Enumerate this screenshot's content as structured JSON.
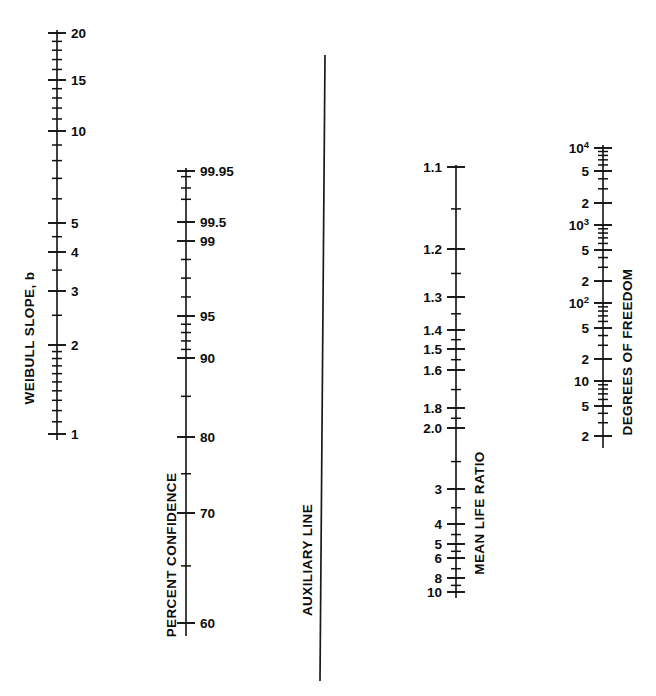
{
  "figure": {
    "type": "nomogram",
    "width": 656,
    "height": 696,
    "background": "#ffffff",
    "ink_color": "#111111"
  },
  "chart_data": {
    "type": "table",
    "title": "",
    "subtitle": "",
    "xlabel": "",
    "ylabel": "",
    "grid": false,
    "legend": "none",
    "scales": [
      {
        "name": "weibull-slope",
        "title": "WEIBULL SLOPE, b",
        "orientation": "vertical",
        "scale_type": "log",
        "direction": "increasing-upward",
        "axis_x": 57,
        "axis_top": 30,
        "axis_bottom": 440,
        "label_side": "right",
        "range": [
          1,
          20
        ],
        "labeled_ticks": [
          {
            "value": 20,
            "label": "20",
            "y": 33
          },
          {
            "value": 15,
            "label": "15",
            "y": 80
          },
          {
            "value": 10,
            "label": "10",
            "y": 131
          },
          {
            "value": 5,
            "label": "5",
            "y": 223
          },
          {
            "value": 4,
            "label": "4",
            "y": 252
          },
          {
            "value": 3,
            "label": "3",
            "y": 291
          },
          {
            "value": 2,
            "label": "2",
            "y": 345
          },
          {
            "value": 1,
            "label": "1",
            "y": 434
          }
        ],
        "minor_ticks": [
          19,
          18,
          17,
          16,
          14,
          13,
          12,
          11,
          9,
          8,
          7,
          6,
          4.5,
          3.5,
          2.5,
          1.9,
          1.8,
          1.7,
          1.6,
          1.5,
          1.4,
          1.3,
          1.2,
          1.1
        ]
      },
      {
        "name": "percent-confidence",
        "title": "PERCENT CONFIDENCE",
        "orientation": "vertical",
        "scale_type": "probability",
        "direction": "increasing-upward",
        "axis_x": 186,
        "axis_top": 168,
        "axis_bottom": 636,
        "label_side": "right",
        "range": [
          55,
          99.95
        ],
        "labeled_ticks": [
          {
            "value": 99.95,
            "label": "99.95",
            "y": 171
          },
          {
            "value": 99.5,
            "label": "99.5",
            "y": 222
          },
          {
            "value": 99,
            "label": "99",
            "y": 241
          },
          {
            "value": 95,
            "label": "95",
            "y": 316
          },
          {
            "value": 90,
            "label": "90",
            "y": 358
          },
          {
            "value": 80,
            "label": "80",
            "y": 437
          },
          {
            "value": 70,
            "label": "70",
            "y": 513
          },
          {
            "value": 60,
            "label": "60",
            "y": 623
          }
        ],
        "minor_ticks": [
          99.9,
          99.8,
          99.7,
          98,
          97,
          96,
          94,
          93,
          92,
          91,
          85,
          75,
          65,
          57
        ]
      },
      {
        "name": "auxiliary-line",
        "title": "AUXILIARY LINE",
        "orientation": "vertical",
        "scale_type": "none",
        "axis_x_top": 325,
        "axis_x_bottom": 320,
        "axis_top": 55,
        "axis_bottom": 681,
        "labeled_ticks": [],
        "minor_ticks": []
      },
      {
        "name": "mean-life-ratio",
        "title": "MEAN LIFE RATIO",
        "orientation": "vertical",
        "scale_type": "log",
        "direction": "increasing-downward",
        "axis_x": 456,
        "axis_top": 165,
        "axis_bottom": 598,
        "label_side": "left",
        "range": [
          1.1,
          10
        ],
        "labeled_ticks": [
          {
            "value": 1.1,
            "label": "1.1",
            "y": 167
          },
          {
            "value": 1.2,
            "label": "1.2",
            "y": 249
          },
          {
            "value": 1.3,
            "label": "1.3",
            "y": 297
          },
          {
            "value": 1.4,
            "label": "1.4",
            "y": 330
          },
          {
            "value": 1.5,
            "label": "1.5",
            "y": 349
          },
          {
            "value": 1.6,
            "label": "1.6",
            "y": 370
          },
          {
            "value": 1.8,
            "label": "1.8",
            "y": 408
          },
          {
            "value": 2.0,
            "label": "2.0",
            "y": 428
          },
          {
            "value": 3,
            "label": "3",
            "y": 489
          },
          {
            "value": 4,
            "label": "4",
            "y": 524
          },
          {
            "value": 5,
            "label": "5",
            "y": 544
          },
          {
            "value": 6,
            "label": "6",
            "y": 558
          },
          {
            "value": 8,
            "label": "8",
            "y": 578
          },
          {
            "value": 10,
            "label": "10",
            "y": 592
          }
        ],
        "minor_ticks": [
          1.15,
          1.25,
          1.35,
          1.45,
          1.55,
          1.7,
          1.9,
          2.5,
          3.5,
          4.5,
          5.5,
          7,
          9
        ]
      },
      {
        "name": "degrees-of-freedom",
        "title": "DEGREES OF FREEDOM",
        "orientation": "vertical",
        "scale_type": "log",
        "direction": "increasing-upward",
        "axis_x": 603,
        "axis_top": 145,
        "axis_bottom": 448,
        "label_side": "left",
        "range": [
          2,
          10000
        ],
        "labeled_ticks": [
          {
            "value": 10000,
            "label": "10",
            "superscript": "4",
            "y": 148
          },
          {
            "value": 5000,
            "label": "5",
            "superscript": "",
            "y": 171
          },
          {
            "value": 2000,
            "label": "2",
            "superscript": "",
            "y": 203
          },
          {
            "value": 1000,
            "label": "10",
            "superscript": "3",
            "y": 225
          },
          {
            "value": 500,
            "label": "5",
            "superscript": "",
            "y": 250
          },
          {
            "value": 200,
            "label": "2",
            "superscript": "",
            "y": 281
          },
          {
            "value": 100,
            "label": "10",
            "superscript": "2",
            "y": 303
          },
          {
            "value": 50,
            "label": "5",
            "superscript": "",
            "y": 328
          },
          {
            "value": 20,
            "label": "2",
            "superscript": "",
            "y": 359
          },
          {
            "value": 10,
            "label": "10",
            "superscript": "",
            "y": 381
          },
          {
            "value": 5,
            "label": "5",
            "superscript": "",
            "y": 406
          },
          {
            "value": 2,
            "label": "2",
            "superscript": "",
            "y": 436
          }
        ],
        "minor_ticks": [
          9000,
          8000,
          7000,
          6000,
          4000,
          3000,
          900,
          800,
          700,
          600,
          400,
          300,
          90,
          80,
          70,
          60,
          40,
          30,
          9,
          8,
          7,
          6,
          4,
          3
        ]
      }
    ]
  }
}
